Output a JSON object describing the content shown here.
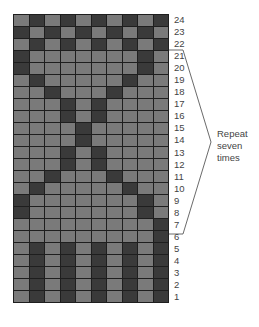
{
  "colors": {
    "light": "#7a7a7a",
    "dark": "#3a3a3a",
    "grid_line": "#1e1e1e",
    "text": "#444444"
  },
  "columns": 10,
  "row_labels": [
    "24",
    "23",
    "22",
    "21",
    "20",
    "19",
    "18",
    "17",
    "16",
    "15",
    "14",
    "13",
    "12",
    "11",
    "10",
    "9",
    "8",
    "7",
    "6",
    "5",
    "4",
    "3",
    "2",
    "1"
  ],
  "rows": [
    "LDLDLDLDLD",
    "DLDLDLDLDL",
    "LDLDLDLDLD",
    "DLLLLLLLDL",
    "DLLLLLLLDL",
    "LDLLLLLDLL",
    "LLDLLLDLLL",
    "LLLDLDLLLL",
    "LLLDLDLLLL",
    "LLLLDLLLLL",
    "LLLLDLLLLL",
    "LLLDLDLLLL",
    "LLLDLDLLLL",
    "LLDLLLDLLL",
    "LDLLLLLDLL",
    "DLLLLLLLDL",
    "DLLLLLLLDL",
    "LLLLLLLLLD",
    "LLLLLLLLLD",
    "LDLDLDLDLD",
    "LDLDLDLDLD",
    "LDLDLDLDLD",
    "LDLDLDLDLD",
    "LDLDLDLDLD"
  ],
  "repeat_bracket": {
    "from_row": "6",
    "to_row": "21"
  },
  "note": {
    "line1": "Repeat",
    "line2": "seven",
    "line3": "times"
  }
}
